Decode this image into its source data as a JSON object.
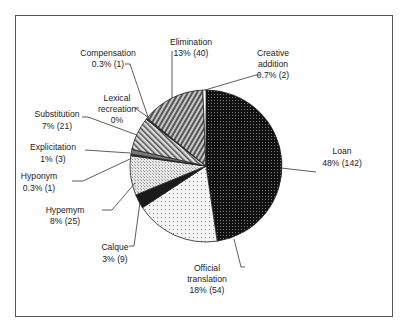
{
  "chart_data": {
    "type": "pie",
    "title": "",
    "start_angle": "12 o'clock, clockwise",
    "total": 298,
    "slices": [
      {
        "label": "Loan",
        "percent_label": "48% (142)",
        "value": 142,
        "percent": 48,
        "pattern": "dark-dots"
      },
      {
        "label": "Official translation",
        "percent_label": "18% (54)",
        "value": 54,
        "percent": 18,
        "pattern": "light-dots"
      },
      {
        "label": "Calque",
        "percent_label": "3% (9)",
        "value": 9,
        "percent": 3,
        "pattern": "black"
      },
      {
        "label": "Hypemym",
        "percent_label": "8% (25)",
        "value": 25,
        "percent": 8,
        "pattern": "light-grid"
      },
      {
        "label": "Hyponym",
        "percent_label": "0.3% (1)",
        "value": 1,
        "percent": 0.3,
        "pattern": "dark"
      },
      {
        "label": "Explicitation",
        "percent_label": "1% (3)",
        "value": 3,
        "percent": 1,
        "pattern": "gray"
      },
      {
        "label": "Substitution",
        "percent_label": "7% (21)",
        "value": 21,
        "percent": 7,
        "pattern": "hatch-left"
      },
      {
        "label": "Lexical recreation",
        "percent_label": "0%",
        "value": 0,
        "percent": 0,
        "pattern": "none"
      },
      {
        "label": "Compensation",
        "percent_label": "0.3% (1)",
        "value": 1,
        "percent": 0.3,
        "pattern": "dark"
      },
      {
        "label": "Elimination",
        "percent_label": "13% (40)",
        "value": 40,
        "percent": 13,
        "pattern": "hatch-right"
      },
      {
        "label": "Creative addition",
        "percent_label": "0.7% (2)",
        "value": 2,
        "percent": 0.7,
        "pattern": "white"
      }
    ],
    "legend": "none (callout labels)"
  },
  "labels": {
    "loan": {
      "l1": "Loan",
      "l2": "48% (142)"
    },
    "official": {
      "l1": "Official",
      "l2": "translation",
      "l3": "18% (54)"
    },
    "calque": {
      "l1": "Calque",
      "l2": "3% (9)"
    },
    "hypernym": {
      "l1": "Hypemym",
      "l2": "8% (25)"
    },
    "hyponym": {
      "l1": "Hyponym",
      "l2": "0.3% (1)"
    },
    "explicitation": {
      "l1": "Explicitation",
      "l2": "1% (3)"
    },
    "substitution": {
      "l1": "Substitution",
      "l2": "7% (21)"
    },
    "lexical": {
      "l1": "Lexical",
      "l2": "recreation",
      "l3": "0%"
    },
    "compensation": {
      "l1": "Compensation",
      "l2": "0.3% (1)"
    },
    "elimination": {
      "l1": "Elimination",
      "l2": "13% (40)"
    },
    "creative": {
      "l1": "Creative",
      "l2": "addition",
      "l3": "0.7% (2)"
    }
  }
}
